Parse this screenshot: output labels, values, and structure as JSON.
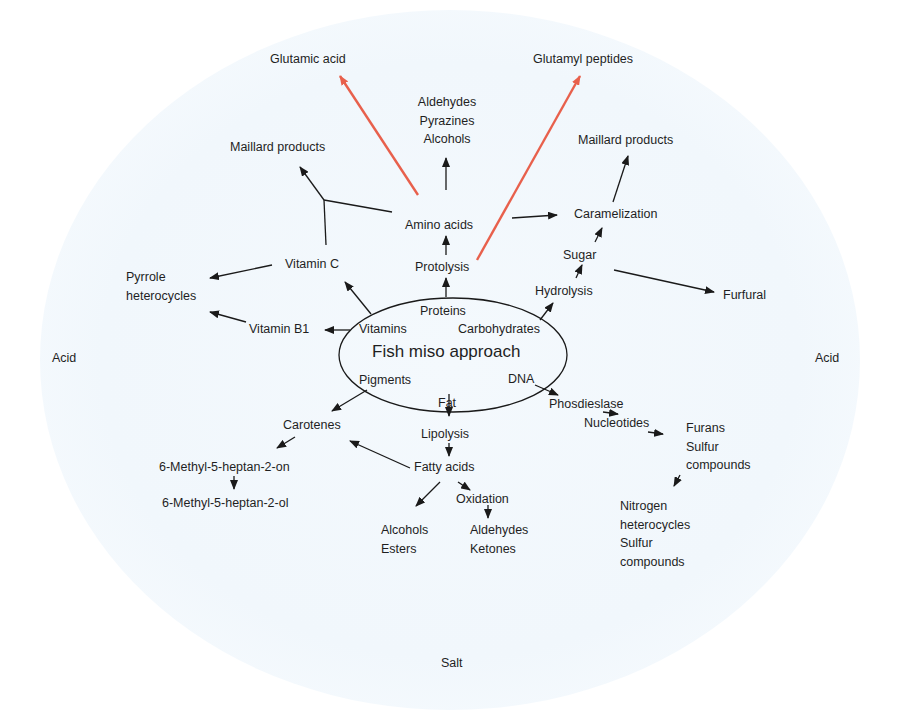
{
  "diagram": {
    "title": "Fish miso approach",
    "environment": {
      "left": "Acid",
      "right": "Acid",
      "bottom": "Salt"
    },
    "center_components": {
      "proteins": "Proteins",
      "vitamins": "Vitamins",
      "carbohydrates": "Carbohydrates",
      "pigments": "Pigments",
      "fat": "Fat",
      "dna": "DNA"
    },
    "nodes": {
      "protolysis": "Protolysis",
      "amino_acids": "Amino acids",
      "glutamic_acid": "Glutamic acid",
      "glutamyl_peptides": "Glutamyl peptides",
      "aldehydes_pyrazines_alcohols": [
        "Aldehydes",
        "Pyrazines",
        "Alcohols"
      ],
      "maillard_left": "Maillard products",
      "maillard_right": "Maillard products",
      "caramelization": "Caramelization",
      "sugar": "Sugar",
      "hydrolysis": "Hydrolysis",
      "furfural": "Furfural",
      "vitamin_c": "Vitamin C",
      "vitamin_b1": "Vitamin B1",
      "pyrrole_heterocycles": [
        "Pyrrole",
        "heterocycles"
      ],
      "carotenes": "Carotenes",
      "methyl_on": "6-Methyl-5-heptan-2-on",
      "methyl_ol": "6-Methyl-5-heptan-2-ol",
      "lipolysis": "Lipolysis",
      "fatty_acids": "Fatty acids",
      "oxidation": "Oxidation",
      "alcohols_esters": [
        "Alcohols",
        "Esters"
      ],
      "aldehydes_ketones": [
        "Aldehydes",
        "Ketones"
      ],
      "phosdieslase": "Phosdieslase",
      "nucleotides": "Nucleotides",
      "furans_sulfur": [
        "Furans",
        "Sulfur",
        "compounds"
      ],
      "nitrogen_sulfur": [
        "Nitrogen",
        "heterocycles",
        "Sulfur",
        "compounds"
      ]
    },
    "colors": {
      "arrow": "#1a1a1a",
      "highlight_arrow": "#e8604c",
      "background_wash": "#f1f7fc"
    }
  }
}
